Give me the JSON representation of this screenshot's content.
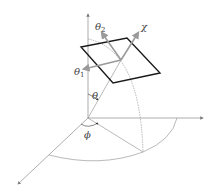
{
  "diagram": {
    "type": "spherical-coordinates-with-tilted-plane",
    "labels": {
      "theta": "θ",
      "phi": "ϕ",
      "theta1": "θ",
      "theta1_sub": "1",
      "theta2": "θ",
      "theta2_sub": "2",
      "chi": "χ"
    },
    "colors": {
      "axis": "#8a8a8a",
      "plane": "#1a1a1a",
      "vector": "#9a9a9a",
      "arc": "#8a8a8a",
      "label": "#444444"
    }
  }
}
